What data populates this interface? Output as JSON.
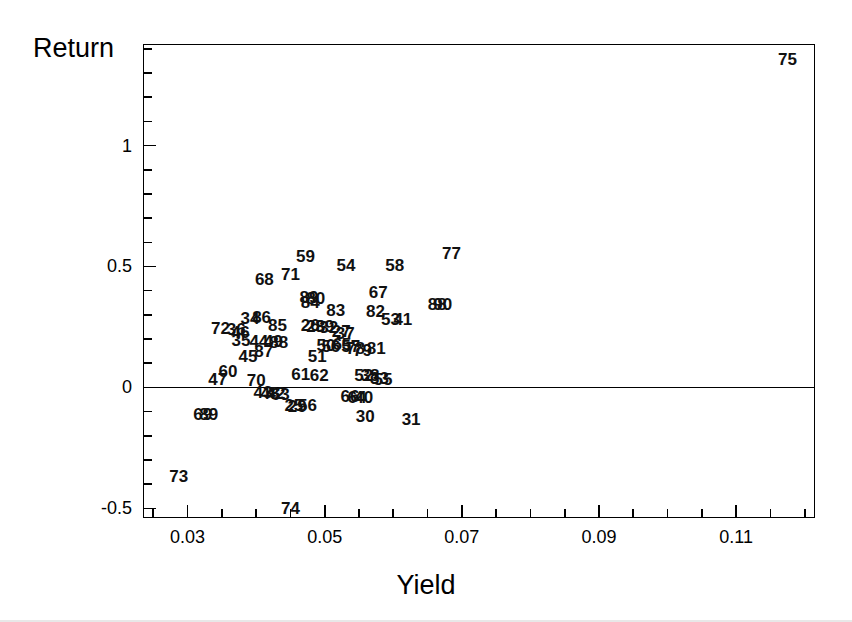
{
  "figure": {
    "background_color": "#ffffff",
    "foreground_color": "#000000"
  },
  "axes": {
    "y_title": "Return",
    "x_title": "Yield",
    "x_tick_labels": [
      "0.03",
      "0.05",
      "0.07",
      "0.09",
      "0.11"
    ],
    "y_tick_labels": [
      "-0.5",
      "0",
      "0.5",
      "1"
    ]
  },
  "chart_data": {
    "type": "scatter",
    "title": "",
    "xlabel": "Yield",
    "ylabel": "Return",
    "xlim": [
      0.0235,
      0.1215
    ],
    "ylim": [
      -0.54,
      1.42
    ],
    "xticks": [
      0.03,
      0.05,
      0.07,
      0.09,
      0.11
    ],
    "yticks": [
      -0.5,
      0.0,
      0.5,
      1.0
    ],
    "minor_tick_step_x": 0.005,
    "minor_tick_step_y": 0.1,
    "grid": false,
    "legend": "none",
    "point_marker": "text-label",
    "annotations": [
      {
        "label": "zero-reference-line",
        "y": 0.0
      }
    ],
    "points": [
      {
        "label": "75",
        "x": 0.1175,
        "y": 1.36
      },
      {
        "label": "77",
        "x": 0.0685,
        "y": 0.555
      },
      {
        "label": "59",
        "x": 0.0472,
        "y": 0.545
      },
      {
        "label": "54",
        "x": 0.0531,
        "y": 0.505
      },
      {
        "label": "58",
        "x": 0.0602,
        "y": 0.505
      },
      {
        "label": "71",
        "x": 0.045,
        "y": 0.47
      },
      {
        "label": "68",
        "x": 0.0412,
        "y": 0.45
      },
      {
        "label": "67",
        "x": 0.0578,
        "y": 0.395
      },
      {
        "label": "89",
        "x": 0.0477,
        "y": 0.375
      },
      {
        "label": "80",
        "x": 0.0487,
        "y": 0.37
      },
      {
        "label": "84",
        "x": 0.0479,
        "y": 0.352
      },
      {
        "label": "88",
        "x": 0.0664,
        "y": 0.345
      },
      {
        "label": "90",
        "x": 0.0672,
        "y": 0.345
      },
      {
        "label": "83",
        "x": 0.0516,
        "y": 0.32
      },
      {
        "label": "82",
        "x": 0.0574,
        "y": 0.318
      },
      {
        "label": "53",
        "x": 0.0596,
        "y": 0.283
      },
      {
        "label": "41",
        "x": 0.0614,
        "y": 0.283
      },
      {
        "label": "34",
        "x": 0.0391,
        "y": 0.288
      },
      {
        "label": "86",
        "x": 0.0408,
        "y": 0.292
      },
      {
        "label": "85",
        "x": 0.0431,
        "y": 0.258
      },
      {
        "label": "26",
        "x": 0.0479,
        "y": 0.258
      },
      {
        "label": "28",
        "x": 0.0487,
        "y": 0.255
      },
      {
        "label": "39",
        "x": 0.05,
        "y": 0.253
      },
      {
        "label": "32",
        "x": 0.0506,
        "y": 0.25
      },
      {
        "label": "72",
        "x": 0.0348,
        "y": 0.245
      },
      {
        "label": "36",
        "x": 0.0371,
        "y": 0.24
      },
      {
        "label": "46",
        "x": 0.0377,
        "y": 0.228
      },
      {
        "label": "27",
        "x": 0.0524,
        "y": 0.232
      },
      {
        "label": "37",
        "x": 0.053,
        "y": 0.225
      },
      {
        "label": "35",
        "x": 0.0378,
        "y": 0.195
      },
      {
        "label": "44",
        "x": 0.0404,
        "y": 0.19
      },
      {
        "label": "49",
        "x": 0.0425,
        "y": 0.19
      },
      {
        "label": "88b",
        "x": 0.0433,
        "y": 0.188
      },
      {
        "label": "50",
        "x": 0.0502,
        "y": 0.175
      },
      {
        "label": "56",
        "x": 0.0509,
        "y": 0.17
      },
      {
        "label": "65",
        "x": 0.0525,
        "y": 0.178
      },
      {
        "label": "57",
        "x": 0.0538,
        "y": 0.172
      },
      {
        "label": "78",
        "x": 0.0545,
        "y": 0.165
      },
      {
        "label": "79",
        "x": 0.0555,
        "y": 0.155
      },
      {
        "label": "81",
        "x": 0.0575,
        "y": 0.163
      },
      {
        "label": "87",
        "x": 0.0411,
        "y": 0.152
      },
      {
        "label": "45",
        "x": 0.0388,
        "y": 0.128
      },
      {
        "label": "51",
        "x": 0.0489,
        "y": 0.13
      },
      {
        "label": "60",
        "x": 0.0359,
        "y": 0.068
      },
      {
        "label": "47",
        "x": 0.0344,
        "y": 0.035
      },
      {
        "label": "70",
        "x": 0.04,
        "y": 0.03
      },
      {
        "label": "61",
        "x": 0.0465,
        "y": 0.055
      },
      {
        "label": "62",
        "x": 0.0492,
        "y": 0.05
      },
      {
        "label": "52",
        "x": 0.0557,
        "y": 0.053
      },
      {
        "label": "38",
        "x": 0.0566,
        "y": 0.05
      },
      {
        "label": "33",
        "x": 0.058,
        "y": 0.038
      },
      {
        "label": "55",
        "x": 0.0585,
        "y": 0.035
      },
      {
        "label": "43",
        "x": 0.041,
        "y": -0.02
      },
      {
        "label": "48",
        "x": 0.042,
        "y": -0.025
      },
      {
        "label": "42",
        "x": 0.0429,
        "y": -0.025
      },
      {
        "label": "63",
        "x": 0.0435,
        "y": -0.028
      },
      {
        "label": "66",
        "x": 0.0537,
        "y": -0.035
      },
      {
        "label": "64",
        "x": 0.0547,
        "y": -0.038
      },
      {
        "label": "40",
        "x": 0.0557,
        "y": -0.038
      },
      {
        "label": "25",
        "x": 0.0455,
        "y": -0.072
      },
      {
        "label": "29",
        "x": 0.046,
        "y": -0.075
      },
      {
        "label": "56b",
        "x": 0.0475,
        "y": -0.072
      },
      {
        "label": "69",
        "x": 0.0322,
        "y": -0.108
      },
      {
        "label": "89b",
        "x": 0.0331,
        "y": -0.11
      },
      {
        "label": "30",
        "x": 0.0559,
        "y": -0.118
      },
      {
        "label": "31",
        "x": 0.0626,
        "y": -0.13
      },
      {
        "label": "73",
        "x": 0.0287,
        "y": -0.365
      },
      {
        "label": "74",
        "x": 0.045,
        "y": -0.498
      }
    ]
  }
}
